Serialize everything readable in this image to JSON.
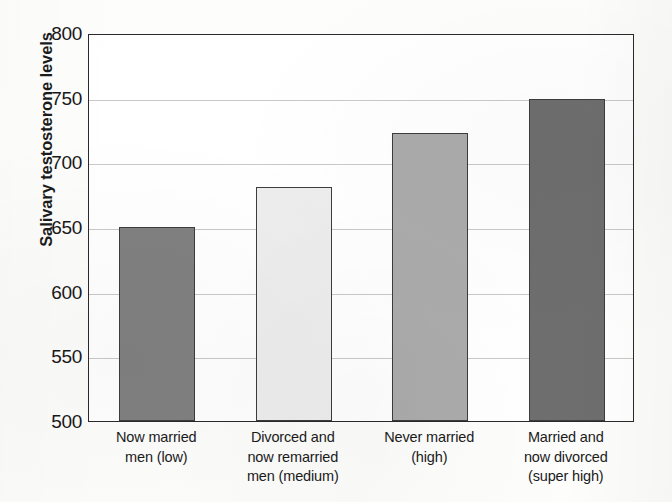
{
  "chart_data": {
    "type": "bar",
    "title": "",
    "xlabel": "",
    "ylabel": "Salivary testosterone levels",
    "ylim": [
      500,
      800
    ],
    "ytick_values": [
      500,
      550,
      600,
      650,
      700,
      750,
      800
    ],
    "ytick_labels": [
      "500",
      "550",
      "600",
      "650",
      "700",
      "750",
      "800"
    ],
    "grid": true,
    "legend": "none",
    "categories": [
      "Now married men (low)",
      "Divorced and now remarried men (medium)",
      "Never married (high)",
      "Married and now divorced (super high)"
    ],
    "category_lines": [
      [
        "Now married",
        "men (low)"
      ],
      [
        "Divorced and",
        "now remarried",
        "men (medium)"
      ],
      [
        "Never married",
        "(high)"
      ],
      [
        "Married and",
        "now divorced",
        "(super high)"
      ]
    ],
    "values": [
      650,
      681,
      723,
      749
    ],
    "bar_colors": [
      "#808080",
      "#ededed",
      "#ababab",
      "#6e6e6e"
    ],
    "bar_edge_color": "#3c3c3c",
    "gridline_color": "#c9c9c9",
    "axis_color": "#2a2a2a"
  }
}
